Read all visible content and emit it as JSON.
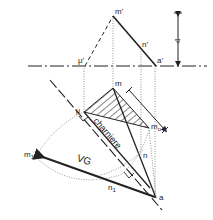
{
  "diagram": {
    "title": "",
    "labels": {
      "m_prime": "m'",
      "n_prime": "n'",
      "a_prime": "a'",
      "mu_prime": "μ'",
      "m": "m",
      "mu": "μ",
      "m0": "m",
      "m0_sub": "o",
      "n": "n",
      "a": "a",
      "m1": "m",
      "m1_sub": "1",
      "n1": "n",
      "n1_sub": "1",
      "vg": "VG",
      "charniere": "charniere",
      "delta_top": "Δ",
      "delta_right": "Δ"
    },
    "colors": {
      "line": "#222222",
      "dotted": "#888888",
      "background": "#ffffff"
    }
  }
}
